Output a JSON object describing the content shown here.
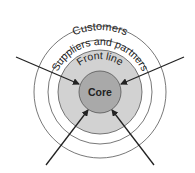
{
  "diagram": {
    "type": "concentric-circles",
    "rings": [
      {
        "id": "customers",
        "label": "Customers",
        "fill": "#ffffff"
      },
      {
        "id": "suppliers",
        "label": "Suppliers and partners",
        "fill": "#ffffff"
      },
      {
        "id": "front_line",
        "label": "Front line",
        "fill": "#d0d0d0"
      },
      {
        "id": "core",
        "label": "Core",
        "fill": "#a8a8a8"
      }
    ],
    "arrows": [
      {
        "from": "top-left",
        "to": "core"
      },
      {
        "from": "top-right",
        "to": "core"
      },
      {
        "from": "bottom-left",
        "to": "core"
      },
      {
        "from": "bottom-right",
        "to": "core"
      }
    ],
    "colors": {
      "stroke": "#444444",
      "arrow": "#222222"
    }
  }
}
